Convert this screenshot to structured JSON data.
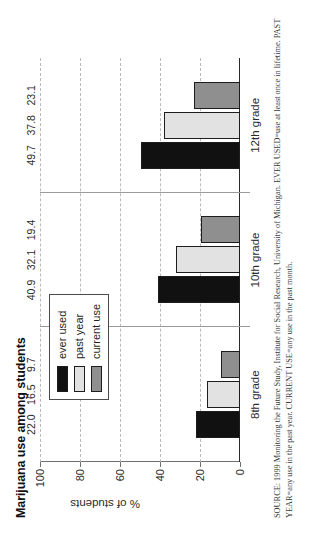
{
  "chart_data": {
    "type": "bar",
    "title": "Marijuana use among students",
    "xlabel": "",
    "ylabel": "% of students",
    "categories": [
      "8th grade",
      "10th grade",
      "12th grade"
    ],
    "series": [
      {
        "name": "ever used",
        "color": "#111111",
        "values": [
          22.0,
          40.9,
          49.7
        ],
        "labels": [
          "22.0",
          "40.9",
          "49.7"
        ]
      },
      {
        "name": "past year",
        "color": "#e2e2e2",
        "values": [
          16.5,
          32.1,
          37.8
        ],
        "labels": [
          "16.5",
          "32.1",
          "37.8"
        ]
      },
      {
        "name": "current use",
        "color": "#8f8f8f",
        "values": [
          9.7,
          19.4,
          23.1
        ],
        "labels": [
          "9.7",
          "19.4",
          "23.1"
        ]
      }
    ],
    "ylim": [
      0,
      100
    ],
    "yticks": [
      "0",
      "20",
      "40",
      "60",
      "80",
      "100"
    ],
    "ytick_values": [
      0,
      20,
      40,
      60,
      80,
      100
    ],
    "grid": true,
    "legend_position": "upper-left",
    "orientation": "vertical-bars-rotated-page"
  },
  "legend": {
    "items": [
      {
        "label": "ever used"
      },
      {
        "label": "past year"
      },
      {
        "label": "current use"
      }
    ]
  },
  "source": {
    "text": "SOURCE: 1999 Monitoring the Future Study, Institute for Social Research, University of Michigan. EVER USED=use at least once in lifetime. PAST YEAR=any use in the past year. CURRENT USE=any use in the past month."
  }
}
